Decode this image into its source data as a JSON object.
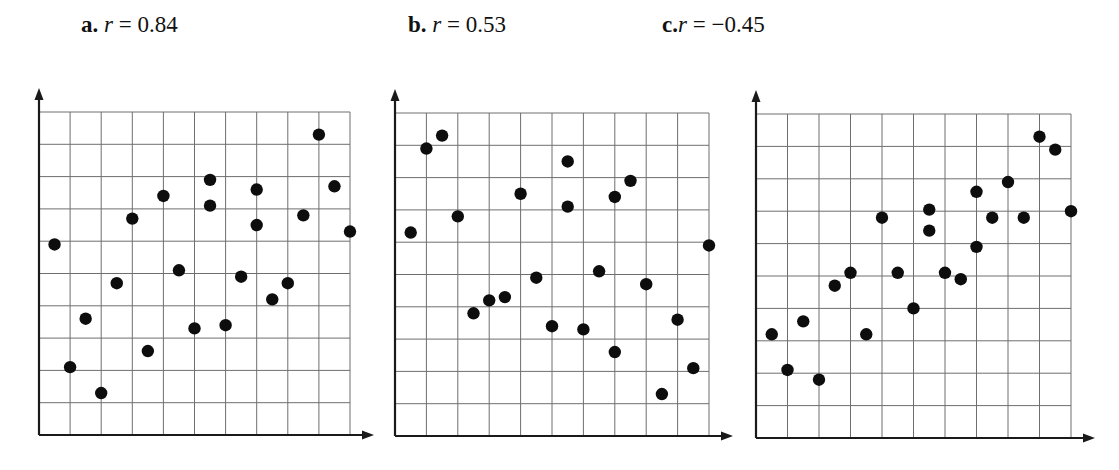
{
  "panels": [
    {
      "letter": "a.",
      "var": "r",
      "eq": " = ",
      "value": "0.84"
    },
    {
      "letter": "b.",
      "var": "r",
      "eq": " = ",
      "value": "0.53"
    },
    {
      "letter": "c.",
      "var": "r",
      "eq": " = ",
      "value": "−0.45"
    }
  ],
  "chart_data": [
    {
      "type": "scatter",
      "title": "a. r = 0.84",
      "xlabel": "",
      "ylabel": "",
      "xlim": [
        0,
        10
      ],
      "ylim": [
        0,
        10
      ],
      "grid": true,
      "points": [
        [
          0.5,
          5.9
        ],
        [
          1.0,
          2.1
        ],
        [
          1.5,
          3.6
        ],
        [
          2.0,
          1.3
        ],
        [
          2.5,
          4.7
        ],
        [
          3.0,
          6.7
        ],
        [
          3.5,
          2.6
        ],
        [
          4.0,
          7.4
        ],
        [
          4.5,
          5.1
        ],
        [
          5.0,
          3.3
        ],
        [
          5.5,
          7.9
        ],
        [
          5.5,
          7.1
        ],
        [
          6.0,
          3.4
        ],
        [
          6.5,
          4.9
        ],
        [
          7.0,
          7.6
        ],
        [
          7.0,
          6.5
        ],
        [
          7.5,
          4.2
        ],
        [
          8.0,
          4.7
        ],
        [
          8.5,
          6.8
        ],
        [
          9.0,
          9.3
        ],
        [
          9.5,
          7.7
        ],
        [
          10.0,
          6.3
        ]
      ]
    },
    {
      "type": "scatter",
      "title": "b. r = 0.53",
      "xlabel": "",
      "ylabel": "",
      "xlim": [
        0,
        10
      ],
      "ylim": [
        0,
        10
      ],
      "grid": true,
      "points": [
        [
          0.5,
          6.3
        ],
        [
          1.0,
          8.9
        ],
        [
          1.5,
          9.3
        ],
        [
          2.0,
          6.8
        ],
        [
          2.5,
          3.8
        ],
        [
          3.0,
          4.2
        ],
        [
          3.5,
          4.3
        ],
        [
          4.0,
          7.5
        ],
        [
          4.5,
          4.9
        ],
        [
          5.0,
          3.4
        ],
        [
          5.5,
          8.5
        ],
        [
          5.5,
          7.1
        ],
        [
          6.0,
          3.3
        ],
        [
          6.5,
          5.1
        ],
        [
          7.0,
          7.4
        ],
        [
          7.0,
          2.6
        ],
        [
          7.5,
          7.9
        ],
        [
          8.0,
          4.7
        ],
        [
          8.5,
          1.3
        ],
        [
          9.0,
          3.6
        ],
        [
          9.5,
          2.1
        ],
        [
          10.0,
          5.9
        ]
      ]
    },
    {
      "type": "scatter",
      "title": "c. r = −0.45",
      "xlabel": "",
      "ylabel": "",
      "xlim": [
        0,
        10
      ],
      "ylim": [
        0,
        10
      ],
      "grid": true,
      "points": [
        [
          0.5,
          3.2
        ],
        [
          1.0,
          2.1
        ],
        [
          1.5,
          3.6
        ],
        [
          2.0,
          1.8
        ],
        [
          2.5,
          4.7
        ],
        [
          3.0,
          5.1
        ],
        [
          3.5,
          3.2
        ],
        [
          4.0,
          6.8
        ],
        [
          4.5,
          5.1
        ],
        [
          5.0,
          4.0
        ],
        [
          5.5,
          7.05
        ],
        [
          5.5,
          6.4
        ],
        [
          6.0,
          5.1
        ],
        [
          6.5,
          4.9
        ],
        [
          7.0,
          7.6
        ],
        [
          7.0,
          5.9
        ],
        [
          7.5,
          6.8
        ],
        [
          8.0,
          7.9
        ],
        [
          8.5,
          6.8
        ],
        [
          9.0,
          9.3
        ],
        [
          9.5,
          8.9
        ],
        [
          10.0,
          7.0
        ]
      ]
    }
  ],
  "layout": {
    "frames": [
      {
        "ox": 39,
        "oy": 435,
        "cell_w": 31.1,
        "cell_h": 32.3,
        "label_x": 81
      },
      {
        "ox": 395,
        "oy": 436,
        "cell_w": 31.4,
        "cell_h": 32.3,
        "label_x": 408
      },
      {
        "ox": 756,
        "oy": 438,
        "cell_w": 31.5,
        "cell_h": 32.4,
        "label_x": 774
      }
    ],
    "grid_color": "#6e6e6e",
    "axis_color": "#1a1a1a",
    "dot_color": "#0d0d0d",
    "dot_radius": 6.2
  }
}
